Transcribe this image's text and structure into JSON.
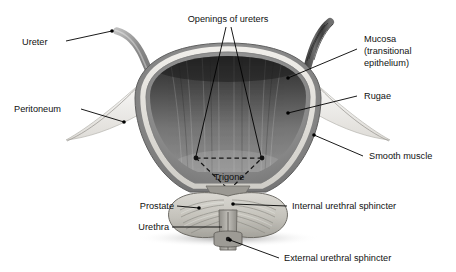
{
  "figure": {
    "background_color": "#ffffff",
    "label_color": "#111111",
    "leader_line_color": "#000000"
  },
  "labels": [
    {
      "id": "ureter",
      "text": "Ureter"
    },
    {
      "id": "peritoneum",
      "text": "Peritoneum"
    },
    {
      "id": "openings-of-ureters",
      "text": "Openings of ureters"
    },
    {
      "id": "mucosa-line1",
      "text": "Mucosa"
    },
    {
      "id": "mucosa-line2",
      "text": "(transitional"
    },
    {
      "id": "mucosa-line3",
      "text": "epithelium)"
    },
    {
      "id": "rugae",
      "text": "Rugae"
    },
    {
      "id": "smooth-muscle",
      "text": "Smooth muscle"
    },
    {
      "id": "trigone",
      "text": "Trigone"
    },
    {
      "id": "prostate",
      "text": "Prostate"
    },
    {
      "id": "urethra",
      "text": "Urethra"
    },
    {
      "id": "internal-urethral-sphincter",
      "text": "Internal urethral sphincter"
    },
    {
      "id": "external-urethral-sphincter",
      "text": "External urethral sphincter"
    }
  ],
  "anatomy_parts": [
    {
      "id": "bladder-wall",
      "name": "Bladder wall (detrusor / smooth muscle)",
      "color": "#8d8d8d"
    },
    {
      "id": "bladder-mucosa",
      "name": "Mucosa band (transitional epithelium)",
      "color": "#e8e6e2"
    },
    {
      "id": "bladder-lumen",
      "name": "Bladder lumen with rugae",
      "color": "#4a4a4a"
    },
    {
      "id": "left-ureter",
      "name": "Left ureter",
      "color": "#9a9a9a"
    },
    {
      "id": "right-ureter",
      "name": "Right ureter",
      "color": "#5a5a5a"
    },
    {
      "id": "peritoneum-flap",
      "name": "Peritoneum serosal flap",
      "color": "#f2f1ee"
    },
    {
      "id": "prostate-gland",
      "name": "Prostate gland",
      "color": "#c9c7c1"
    },
    {
      "id": "urethra-canal",
      "name": "Urethra",
      "color": "#b5b3ad"
    },
    {
      "id": "trigone-region",
      "name": "Trigone (dashed triangle)",
      "color": "#1a1a1a"
    }
  ]
}
